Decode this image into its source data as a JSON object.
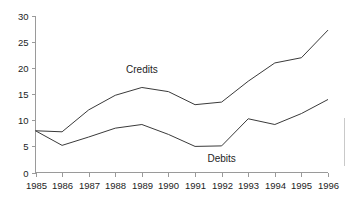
{
  "chart_data": {
    "type": "line",
    "title": "",
    "subtitle": "",
    "xlabel": "",
    "ylabel": "",
    "categories": [
      "1985",
      "1986",
      "1987",
      "1988",
      "1989",
      "1990",
      "1991",
      "1992",
      "1993",
      "1994",
      "1995",
      "1996"
    ],
    "x": [
      1985,
      1986,
      1987,
      1988,
      1989,
      1990,
      1991,
      1992,
      1993,
      1994,
      1995,
      1996
    ],
    "series": [
      {
        "name": "Credits",
        "values": [
          8.0,
          7.8,
          12.0,
          14.8,
          16.3,
          15.5,
          13.0,
          13.5,
          17.5,
          21.0,
          22.0,
          27.3
        ],
        "color": "#3a3a3a",
        "label_anchor_index": 4,
        "label_text": "Credits"
      },
      {
        "name": "Debits",
        "values": [
          8.0,
          5.2,
          6.8,
          8.5,
          9.2,
          7.3,
          5.0,
          5.1,
          10.3,
          9.2,
          11.3,
          14.0
        ],
        "color": "#3a3a3a",
        "label_anchor_index": 7,
        "label_text": "Debits"
      }
    ],
    "ylim": [
      0,
      30
    ],
    "yticks": [
      0,
      5,
      10,
      15,
      20,
      25,
      30
    ],
    "ytick_labels": [
      "0",
      "5",
      "10",
      "15",
      "20",
      "25",
      "30"
    ],
    "xlim": [
      1985,
      1996
    ],
    "grid": false,
    "legend": "inline-annotations",
    "legend_position": "none"
  },
  "axes": {
    "y_axis_name": "value-axis",
    "x_axis_name": "year-axis"
  },
  "annotations": {
    "credits_label": "Credits",
    "debits_label": "Debits"
  }
}
